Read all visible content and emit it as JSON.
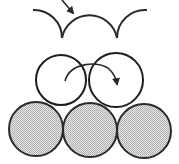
{
  "diagram": {
    "colors": {
      "stroke": "#2a2a2a",
      "shade": "#c8c8c8",
      "background": "#ffffff"
    },
    "panels": [
      {
        "id": "surface-profile",
        "arcs": 3,
        "arrow": "incoming-down-right"
      },
      {
        "id": "second-layer",
        "spheres": 2,
        "style": "open",
        "arrow": "curved-clockwise"
      },
      {
        "id": "base-layer",
        "spheres": 3,
        "style": "shaded"
      }
    ]
  }
}
